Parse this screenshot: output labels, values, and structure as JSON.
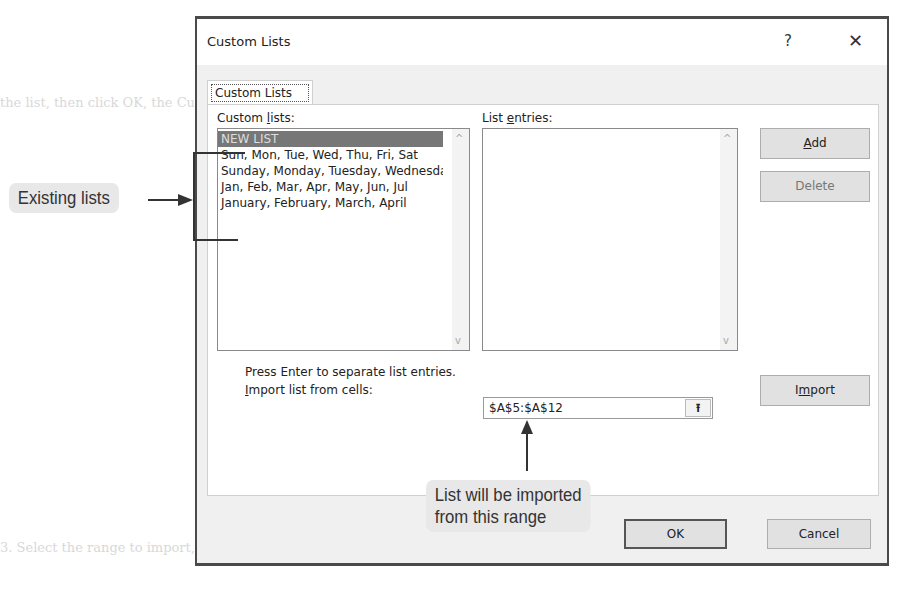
{
  "dialog": {
    "title": "Custom Lists",
    "help_label": "?",
    "close_label": "✕",
    "tab_label": "Custom Lists",
    "custom_lists_label_pre": "Custom ",
    "custom_lists_label_u": "l",
    "custom_lists_label_post": "ists:",
    "list_entries_label_pre": "List ",
    "list_entries_label_u": "e",
    "list_entries_label_post": "ntries:",
    "custom_lists": [
      "NEW LIST",
      "Sun, Mon, Tue, Wed, Thu, Fri, Sat",
      "Sunday, Monday, Tuesday, Wednesday",
      "Jan, Feb, Mar, Apr, May, Jun, Jul",
      "January, February, March, April"
    ],
    "selected_index": 0,
    "add_u": "A",
    "add_rest": "dd",
    "delete_label": "Delete",
    "hint": "Press Enter to separate list entries.",
    "import_label_u": "I",
    "import_label_rest": "mport list from cells:",
    "import_range": "$A$5:$A$12",
    "collapse_icon": "⭱",
    "import_btn_pre": "I",
    "import_btn_u": "m",
    "import_btn_post": "port",
    "ok_label": "OK",
    "cancel_label": "Cancel",
    "scroll_up": "^",
    "scroll_down": "v"
  },
  "callouts": {
    "existing_lists": "Existing lists",
    "import_range_line1": "List will be imported",
    "import_range_line2": "from this range"
  },
  "background": {
    "faded_text_note": "ghosted textbook text behind dialog"
  }
}
